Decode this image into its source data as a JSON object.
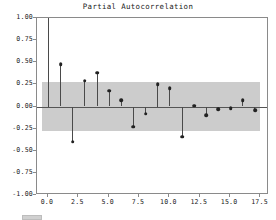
{
  "chart_data": {
    "type": "bar",
    "title": "Partial Autocorrelation",
    "xlabel": "",
    "ylabel": "",
    "x": [
      0,
      1,
      2,
      3,
      4,
      5,
      6,
      7,
      8,
      9,
      10,
      11,
      12,
      13,
      14,
      15,
      16,
      17
    ],
    "values": [
      1.0,
      0.48,
      -0.4,
      0.29,
      0.38,
      0.18,
      0.07,
      -0.23,
      -0.08,
      0.25,
      0.21,
      -0.34,
      0.01,
      -0.1,
      -0.03,
      -0.02,
      0.07,
      -0.04
    ],
    "categories": [
      "0",
      "1",
      "2",
      "3",
      "4",
      "5",
      "6",
      "7",
      "8",
      "9",
      "10",
      "11",
      "12",
      "13",
      "14",
      "15",
      "16",
      "17"
    ],
    "series": [
      {
        "name": "Partial Autocorrelation",
        "values": [
          1.0,
          0.48,
          -0.4,
          0.29,
          0.38,
          0.18,
          0.07,
          -0.23,
          -0.08,
          0.25,
          0.21,
          -0.34,
          0.01,
          -0.1,
          -0.03,
          -0.02,
          0.07,
          -0.04
        ]
      }
    ],
    "confidence_band": {
      "upper": 0.28,
      "lower": -0.28,
      "x_start": -0.5,
      "x_end": 17.5,
      "color": "#c8c8c8"
    },
    "xlim": [
      -0.9,
      18.2
    ],
    "ylim": [
      -1.0,
      1.0
    ],
    "xticks": [
      0.0,
      2.5,
      5.0,
      7.5,
      10.0,
      12.5,
      15.0,
      17.5
    ],
    "xticklabels": [
      "0.0",
      "2.5",
      "5.0",
      "7.5",
      "10.0",
      "12.5",
      "15.0",
      "17.5"
    ],
    "yticks": [
      -1.0,
      -0.75,
      -0.5,
      -0.25,
      0.0,
      0.25,
      0.5,
      0.75,
      1.0
    ],
    "yticklabels": [
      "-1.00",
      "-0.75",
      "-0.50",
      "-0.25",
      "0.00",
      "0.25",
      "0.50",
      "0.75",
      "1.00"
    ],
    "grid": false,
    "legend": "none",
    "marker_color": "#222222",
    "stem_color": "#4a4a4a",
    "zero_line_color": "#555555",
    "axes_color": "#8a8a8a",
    "background": "#ffffff"
  }
}
